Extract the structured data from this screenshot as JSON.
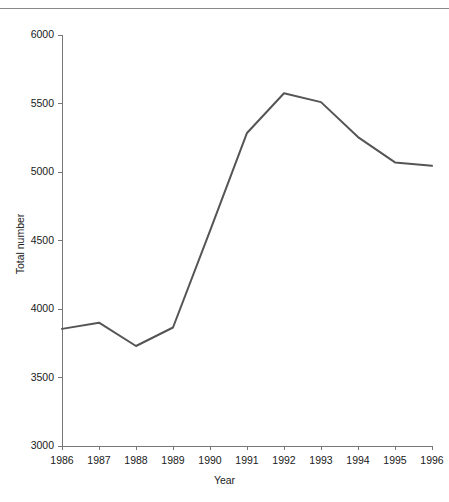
{
  "figure": {
    "top_rule": "horizontal-rule",
    "caption_fragment": ""
  },
  "chart_data": {
    "type": "line",
    "title": "",
    "subtitle": "",
    "xlabel": "Year",
    "ylabel": "Total number",
    "categories": [
      "1986",
      "1987",
      "1988",
      "1989",
      "1990",
      "1991",
      "1992",
      "1993",
      "1994",
      "1995",
      "1996"
    ],
    "x": [
      1986,
      1987,
      1988,
      1989,
      1990,
      1991,
      1992,
      1993,
      1994,
      1995,
      1996
    ],
    "values": [
      3855,
      3900,
      3730,
      3865,
      4570,
      5285,
      5575,
      5510,
      5255,
      5070,
      5045
    ],
    "series": [
      {
        "name": "Total number",
        "values": [
          3855,
          3900,
          3730,
          3865,
          4570,
          5285,
          5575,
          5510,
          5255,
          5070,
          5045
        ],
        "color": "#555555",
        "line_width": 2,
        "marker": "none"
      }
    ],
    "ylim": [
      3000,
      6000
    ],
    "xlim": [
      1986,
      1996
    ],
    "yticks": [
      3000,
      3500,
      4000,
      4500,
      5000,
      5500,
      6000
    ],
    "ytick_labels": [
      "3000",
      "3500",
      "4000",
      "4500",
      "5000",
      "5500",
      "6000"
    ],
    "xticks": [
      1986,
      1987,
      1988,
      1989,
      1990,
      1991,
      1992,
      1993,
      1994,
      1995,
      1996
    ],
    "xtick_labels": [
      "1986",
      "1987",
      "1988",
      "1989",
      "1990",
      "1991",
      "1992",
      "1993",
      "1994",
      "1995",
      "1996"
    ],
    "grid": false,
    "legend": false,
    "legend_position": "none",
    "axis_color": "#777777",
    "text_color": "#1a1a1a",
    "background": "#ffffff",
    "annotations": []
  }
}
